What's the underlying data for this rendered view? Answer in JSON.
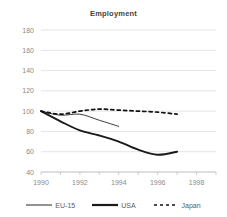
{
  "chart_data": {
    "type": "line",
    "title": "Employment",
    "xlabel": "",
    "ylabel": "",
    "xlim": [
      1990,
      1999
    ],
    "ylim": [
      40,
      180
    ],
    "ytick_labels": [
      "180",
      "160",
      "140",
      "120",
      "100",
      "80",
      "60",
      "40"
    ],
    "yticks": [
      180,
      160,
      140,
      120,
      100,
      80,
      60,
      40
    ],
    "xtick_labels": [
      "1990",
      "1992",
      "1994",
      "1996",
      "1998"
    ],
    "xticks": [
      1990,
      1992,
      1994,
      1996,
      1998
    ],
    "grid": "horizontal",
    "legend_position": "bottom",
    "series": [
      {
        "name": "EU-15",
        "style": "solid-thin",
        "color": "#3a3a3a",
        "x": [
          1990,
          1991,
          1992,
          1993,
          1994
        ],
        "values": [
          100,
          96,
          97,
          91,
          85
        ]
      },
      {
        "name": "USA",
        "style": "solid-thick",
        "color": "#1a1a1a",
        "x": [
          1990,
          1991,
          1992,
          1993,
          1994,
          1995,
          1996,
          1997
        ],
        "values": [
          100,
          90,
          81,
          76,
          70,
          62,
          57,
          60
        ]
      },
      {
        "name": "Japan",
        "style": "dashed",
        "color": "#111111",
        "x": [
          1990,
          1991,
          1992,
          1993,
          1994,
          1995,
          1996,
          1997
        ],
        "values": [
          100,
          97,
          100,
          102,
          101,
          100,
          99,
          97
        ]
      }
    ]
  },
  "legend": {
    "items": [
      {
        "label": "EU-15",
        "swatch": "line-solid-thin-icon"
      },
      {
        "label": "USA",
        "swatch": "line-solid-thick-icon"
      },
      {
        "label": "Japan",
        "swatch": "line-dashed-icon"
      }
    ]
  },
  "axis": {
    "y": {
      "labels": [
        "180",
        "160",
        "140",
        "120",
        "100",
        "80",
        "60",
        "40"
      ]
    },
    "x": {
      "labels": [
        "1990",
        "1992",
        "1994",
        "1996",
        "1998"
      ]
    }
  }
}
